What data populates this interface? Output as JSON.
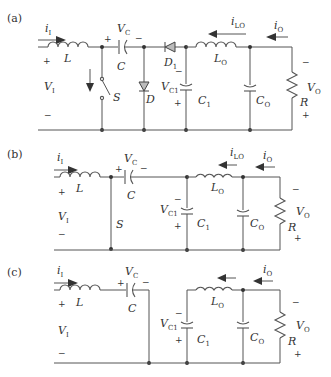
{
  "figure": {
    "panels": [
      {
        "id": "a",
        "tag": "(a)",
        "labels": {
          "input_current": {
            "main": "i",
            "sub": "I"
          },
          "input_inductor": "L",
          "input_voltage": {
            "main": "V",
            "sub": "I"
          },
          "input_plus": "+",
          "input_minus": "−",
          "cap_voltage": {
            "main": "V",
            "sub": "C"
          },
          "cap_plus": "+",
          "cap_minus": "−",
          "cap": "C",
          "switch": "S",
          "diode": "D",
          "diode1": {
            "main": "D",
            "sub": "1"
          },
          "c1_voltage": {
            "main": "V",
            "sub": "C1"
          },
          "c1_minus": "−",
          "c1_plus": "+",
          "c1": {
            "main": "C",
            "sub": "1"
          },
          "lo_current": {
            "main": "i",
            "sub": "LO"
          },
          "lo": {
            "main": "L",
            "sub": "O"
          },
          "out_current": {
            "main": "i",
            "sub": "O"
          },
          "co": {
            "main": "C",
            "sub": "O"
          },
          "out_voltage": {
            "main": "V",
            "sub": "O"
          },
          "out_minus": "−",
          "out_plus": "+",
          "load": "R"
        }
      },
      {
        "id": "b",
        "tag": "(b)",
        "labels": {
          "input_current": {
            "main": "i",
            "sub": "I"
          },
          "input_inductor": "L",
          "input_voltage": {
            "main": "V",
            "sub": "I"
          },
          "input_plus": "+",
          "input_minus": "−",
          "cap_voltage": {
            "main": "V",
            "sub": "C"
          },
          "cap_plus": "+",
          "cap_minus": "−",
          "cap": "C",
          "switch": "S",
          "c1_voltage": {
            "main": "V",
            "sub": "C1"
          },
          "c1_minus": "−",
          "c1_plus": "+",
          "c1": {
            "main": "C",
            "sub": "1"
          },
          "lo_current": {
            "main": "i",
            "sub": "LO"
          },
          "lo": {
            "main": "L",
            "sub": "O"
          },
          "out_current": {
            "main": "i",
            "sub": "O"
          },
          "co": {
            "main": "C",
            "sub": "O"
          },
          "out_voltage": {
            "main": "V",
            "sub": "O"
          },
          "out_minus": "−",
          "out_plus": "+",
          "load": "R"
        }
      },
      {
        "id": "c",
        "tag": "(c)",
        "labels": {
          "input_current": {
            "main": "i",
            "sub": "I"
          },
          "input_inductor": "L",
          "input_voltage": {
            "main": "V",
            "sub": "I"
          },
          "input_plus": "+",
          "input_minus": "−",
          "cap_voltage": {
            "main": "V",
            "sub": "C"
          },
          "cap_plus": "+",
          "cap_minus": "−",
          "cap": "C",
          "c1_voltage": {
            "main": "V",
            "sub": "C1"
          },
          "c1_minus": "−",
          "c1_plus": "+",
          "c1": {
            "main": "C",
            "sub": "1"
          },
          "lo": {
            "main": "L",
            "sub": "O"
          },
          "out_current": {
            "main": "i",
            "sub": "O"
          },
          "co": {
            "main": "C",
            "sub": "O"
          },
          "out_voltage": {
            "main": "V",
            "sub": "O"
          },
          "out_minus": "−",
          "out_plus": "+",
          "load": "R"
        }
      }
    ]
  }
}
